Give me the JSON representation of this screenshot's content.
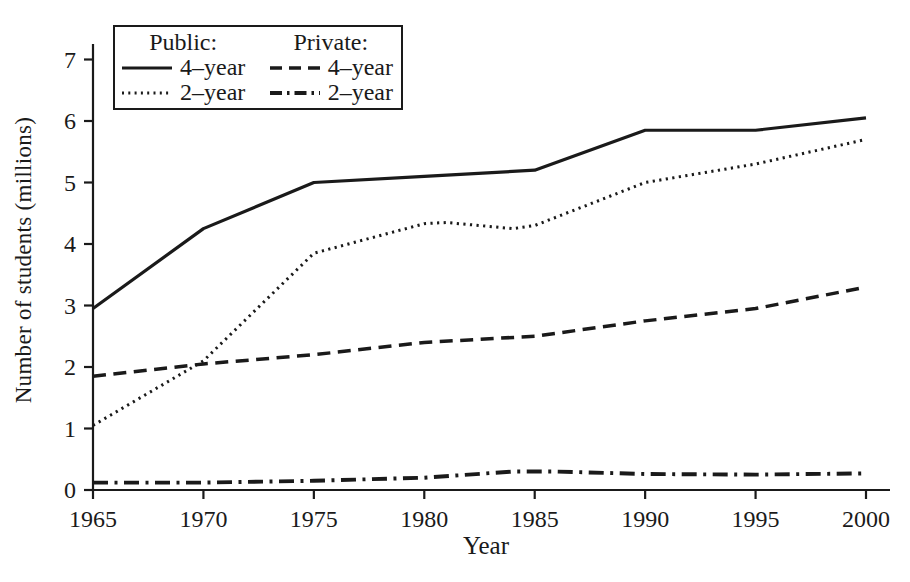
{
  "figure": {
    "background": "#ffffff",
    "ink_color": "#1a1a1a"
  },
  "chart_data": {
    "type": "line",
    "title": "",
    "xlabel": "Year",
    "ylabel": "Number of students (millions)",
    "xlim": [
      1965,
      2000
    ],
    "ylim": [
      0,
      7
    ],
    "x_ticks": [
      "1965",
      "1970",
      "1975",
      "1980",
      "1985",
      "1990",
      "1995",
      "2000"
    ],
    "y_ticks": [
      "0",
      "1",
      "2",
      "3",
      "4",
      "5",
      "6",
      "7"
    ],
    "grid": false,
    "legend_position": "top-left",
    "legend": {
      "groups": [
        {
          "header": "Public:",
          "entries": [
            {
              "label": "4–year",
              "style": "solid"
            },
            {
              "label": "2–year",
              "style": "dotted"
            }
          ]
        },
        {
          "header": "Private:",
          "entries": [
            {
              "label": "4–year",
              "style": "dashed"
            },
            {
              "label": "2–year",
              "style": "dashdot"
            }
          ]
        }
      ]
    },
    "series": [
      {
        "name": "Public 4-year",
        "style": "solid",
        "points": [
          [
            1965,
            2.95
          ],
          [
            1970,
            4.25
          ],
          [
            1975,
            5.0
          ],
          [
            1980,
            5.1
          ],
          [
            1985,
            5.2
          ],
          [
            1990,
            5.85
          ],
          [
            1995,
            5.85
          ],
          [
            2000,
            6.05
          ]
        ]
      },
      {
        "name": "Public 2-year",
        "style": "dotted",
        "points": [
          [
            1965,
            1.05
          ],
          [
            1970,
            2.1
          ],
          [
            1975,
            3.85
          ],
          [
            1980,
            4.33
          ],
          [
            1981,
            4.35
          ],
          [
            1984,
            4.25
          ],
          [
            1985,
            4.3
          ],
          [
            1990,
            5.0
          ],
          [
            1995,
            5.3
          ],
          [
            2000,
            5.7
          ]
        ]
      },
      {
        "name": "Private 4-year",
        "style": "dashed",
        "points": [
          [
            1965,
            1.85
          ],
          [
            1970,
            2.05
          ],
          [
            1975,
            2.2
          ],
          [
            1980,
            2.4
          ],
          [
            1985,
            2.5
          ],
          [
            1990,
            2.75
          ],
          [
            1995,
            2.95
          ],
          [
            2000,
            3.3
          ]
        ]
      },
      {
        "name": "Private 2-year",
        "style": "dashdot",
        "points": [
          [
            1965,
            0.12
          ],
          [
            1970,
            0.12
          ],
          [
            1975,
            0.15
          ],
          [
            1980,
            0.2
          ],
          [
            1984,
            0.3
          ],
          [
            1986,
            0.3
          ],
          [
            1990,
            0.26
          ],
          [
            1995,
            0.25
          ],
          [
            2000,
            0.27
          ]
        ]
      }
    ]
  }
}
